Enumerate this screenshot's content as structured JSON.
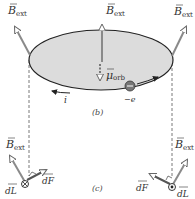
{
  "figure": {
    "panel_b_label": "(b)",
    "panel_c_label": "(c)",
    "labels": {
      "b_ext_symbol": "B",
      "b_ext_sub": "ext",
      "mu_symbol": "μ",
      "mu_sub": "orb",
      "current": "i",
      "electron": "−e",
      "dL": "dL",
      "dF": "dF"
    },
    "colors": {
      "disk_fill": "#dcdcdc",
      "outline": "#222222",
      "b_arrow": "#8a8a8a",
      "force_arrow": "#555555",
      "electron": "#777777"
    }
  }
}
